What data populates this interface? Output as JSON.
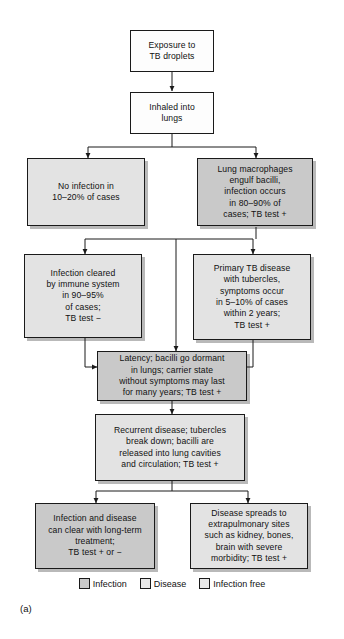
{
  "figure": {
    "panel_label": "(a)",
    "colors": {
      "infection": "#c9c9c9",
      "disease": "#e3e3e3",
      "infection_free": "#e3e3e3",
      "box_white": "#fdfdfd",
      "outline": "#1a1a1a",
      "shadow": "#b9b9b9"
    }
  },
  "nodes": {
    "exposure": "Exposure to\nTB droplets",
    "inhaled": "Inhaled into\nlungs",
    "no_infection": "No infection in\n10–20% of cases",
    "macrophages": "Lung macrophages\nengulf bacilli,\ninfection occurs\nin 80–90% of\ncases; TB test +",
    "cleared": "Infection cleared\nby immune system\nin 90–95%\nof cases;\nTB test −",
    "primary": "Primary TB disease\nwith tubercles,\nsymptoms occur\nin 5–10% of cases\nwithin 2 years;\nTB test +",
    "latency": "Latency; bacilli go dormant\nin lungs; carrier state\nwithout symptoms may last\nfor many years; TB test +",
    "recurrent": "Recurrent disease; tubercles\nbreak down; bacilli are\nreleased into lung cavities\nand circulation; TB test +",
    "clear_treatment": "Infection and disease\ncan clear with long-term\ntreatment;\nTB test + or −",
    "extrapulmonary": "Disease spreads to\nextrapulmonary sites\nsuch as kidney, bones,\nbrain with severe\nmorbidity; TB test +"
  },
  "legend": {
    "items": [
      {
        "label": "Infection",
        "color": "#c9c9c9"
      },
      {
        "label": "Disease",
        "color": "#e3e3e3"
      },
      {
        "label": "Infection free",
        "color": "#e3e3e3"
      }
    ]
  }
}
